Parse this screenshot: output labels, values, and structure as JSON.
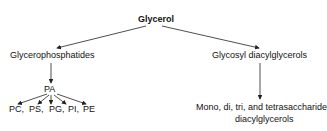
{
  "diagram": {
    "root": "Glycerol",
    "left_branch": "Glycerophosphatides",
    "right_branch": "Glycosyl diacylglycerols",
    "intermediate": "PA",
    "products": [
      "PC,",
      "PS,",
      "PG,",
      "PI,",
      "PE"
    ],
    "right_product_line1": "Mono, di, tri, and tetrasaccharide",
    "right_product_line2": "diacylglycerols"
  }
}
